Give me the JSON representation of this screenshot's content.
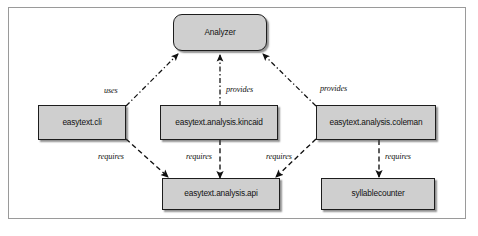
{
  "diagram": {
    "frame": {
      "border_color": "#9a9a9a"
    },
    "node_fill": "#cfcfcf",
    "node_stroke": "#1d1d1d",
    "nodes": [
      {
        "id": "analyzer",
        "label": "Analyzer",
        "shape": "rounded-rectangle"
      },
      {
        "id": "cli",
        "label": "easytext.cli",
        "shape": "rectangle"
      },
      {
        "id": "kincaid",
        "label": "easytext.analysis.kincaid",
        "shape": "rectangle"
      },
      {
        "id": "coleman",
        "label": "easytext.analysis.coleman",
        "shape": "rectangle"
      },
      {
        "id": "api",
        "label": "easytext.analysis.api",
        "shape": "rectangle"
      },
      {
        "id": "syllable",
        "label": "syllablecounter",
        "shape": "rectangle"
      }
    ],
    "edges": [
      {
        "from": "cli",
        "to": "analyzer",
        "label": "uses",
        "style": "dash-dot"
      },
      {
        "from": "kincaid",
        "to": "analyzer",
        "label": "provides",
        "style": "dash-dot"
      },
      {
        "from": "coleman",
        "to": "analyzer",
        "label": "provides",
        "style": "dash-dot"
      },
      {
        "from": "cli",
        "to": "api",
        "label": "requires",
        "style": "dashed"
      },
      {
        "from": "kincaid",
        "to": "api",
        "label": "requires",
        "style": "dashed"
      },
      {
        "from": "coleman",
        "to": "api",
        "label": "requires",
        "style": "dashed"
      },
      {
        "from": "coleman",
        "to": "syllable",
        "label": "requires",
        "style": "dashed"
      }
    ]
  }
}
